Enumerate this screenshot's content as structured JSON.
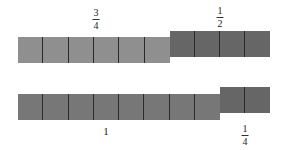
{
  "diagram": {
    "colors": {
      "light": "#8f8f8f",
      "dark": "#666666",
      "divider": "#2a2a2a"
    },
    "top_row": {
      "label_left": {
        "numerator": "3",
        "denominator": "4"
      },
      "label_right": {
        "numerator": "1",
        "denominator": "2"
      },
      "left_bar_cells": 6,
      "right_bar_cells": 4
    },
    "bottom_row": {
      "label_left": "1",
      "label_right": {
        "numerator": "1",
        "denominator": "4"
      },
      "left_bar_cells": 8,
      "right_bar_cells": 2
    }
  }
}
